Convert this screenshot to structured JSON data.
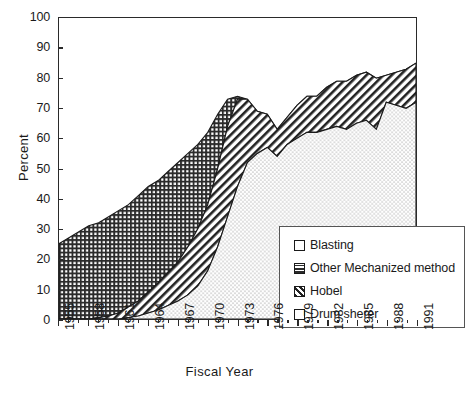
{
  "chart_data": {
    "type": "area",
    "title": "",
    "xlabel": "Fiscal Year",
    "ylabel": "Percent",
    "ylim": [
      0,
      100
    ],
    "xlim": [
      1955,
      1991
    ],
    "ytick_step": 10,
    "yticks": [
      0,
      10,
      20,
      30,
      40,
      50,
      60,
      70,
      80,
      90,
      100
    ],
    "xticks": [
      1955,
      1958,
      1961,
      1964,
      1967,
      1970,
      1973,
      1976,
      1979,
      1982,
      1985,
      1988,
      1991
    ],
    "xtick_labels": [
      "1955",
      "1958",
      "1961",
      "1964",
      "1967",
      "1970",
      "1973",
      "1976",
      "1979",
      "1982",
      "1985",
      "1988",
      "1991"
    ],
    "grid": false,
    "stacked": true,
    "legend_position": "center-right-inside",
    "x": [
      1955,
      1956,
      1957,
      1958,
      1959,
      1960,
      1961,
      1962,
      1963,
      1964,
      1965,
      1966,
      1967,
      1968,
      1969,
      1970,
      1971,
      1972,
      1973,
      1974,
      1975,
      1976,
      1977,
      1978,
      1979,
      1980,
      1981,
      1982,
      1983,
      1984,
      1985,
      1986,
      1987,
      1988,
      1989,
      1990,
      1991
    ],
    "series": [
      {
        "name": "Drum sherer",
        "pattern": "stipple",
        "values": [
          0,
          0,
          0,
          0,
          0,
          0,
          0,
          0.5,
          1,
          2,
          3,
          4.5,
          6,
          8,
          11,
          16,
          24,
          34,
          44,
          52,
          55,
          57,
          54,
          58,
          60,
          62,
          62,
          63,
          64,
          63,
          65,
          66,
          63,
          72,
          71,
          70,
          72
        ]
      },
      {
        "name": "Hobel",
        "pattern": "diagonal-hatch",
        "values": [
          0,
          0,
          0,
          0,
          0.5,
          1,
          2,
          3.5,
          5,
          7,
          9,
          11,
          13,
          16,
          19,
          22,
          26,
          30,
          29,
          21,
          14,
          11,
          9,
          9,
          11,
          12,
          12,
          14,
          15,
          16,
          16,
          16,
          17,
          9,
          11,
          13,
          13
        ]
      },
      {
        "name": "Other Mechanized method",
        "pattern": "crosshatch",
        "values": [
          25,
          27,
          29,
          31,
          32,
          34,
          36,
          38,
          41,
          44,
          46,
          49,
          52,
          55,
          58,
          62,
          68,
          73,
          74,
          73,
          69,
          68,
          63,
          67,
          71,
          74,
          74,
          77,
          79,
          79,
          81,
          82,
          80,
          81,
          82,
          83,
          85
        ]
      },
      {
        "name": "Blasting",
        "pattern": "blank",
        "note": "remainder of 100 percent above the stacked mechanized layers"
      }
    ],
    "stack_top_total": [
      25,
      27,
      29,
      31,
      32,
      34,
      36,
      38,
      41,
      44,
      46,
      49,
      52,
      55,
      58,
      62,
      68,
      73,
      74,
      73,
      69,
      68,
      63,
      67,
      71,
      74,
      74,
      77,
      79,
      79,
      81,
      82,
      80,
      81,
      82,
      83,
      85
    ]
  },
  "legend": {
    "items": [
      {
        "label": "Blasting",
        "swatch": "blank-swatch-icon"
      },
      {
        "label": "Other Mechanized method",
        "swatch": "crosshatch-swatch-icon"
      },
      {
        "label": "Hobel",
        "swatch": "diagonal-hatch-swatch-icon"
      },
      {
        "label": "Drum sherer",
        "swatch": "stipple-swatch-icon"
      }
    ]
  },
  "caption": {
    "remnant": ""
  }
}
